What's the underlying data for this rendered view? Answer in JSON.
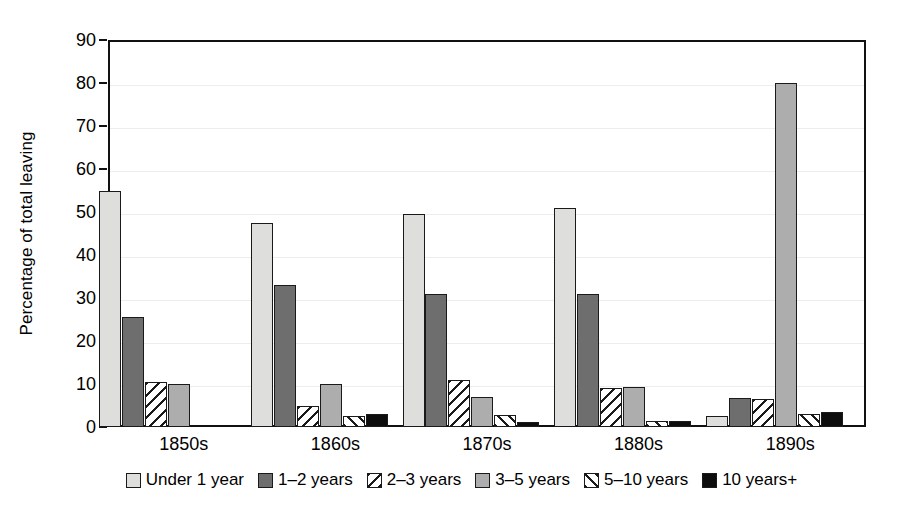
{
  "chart_data": {
    "type": "bar",
    "title": "",
    "xlabel": "",
    "ylabel": "Percentage of total leaving",
    "ylim": [
      0,
      90
    ],
    "ytick_step": 10,
    "yticks": [
      0,
      10,
      20,
      30,
      40,
      50,
      60,
      70,
      80,
      90
    ],
    "grid": true,
    "legend_position": "bottom",
    "categories": [
      "1850s",
      "1860s",
      "1870s",
      "1880s",
      "1890s"
    ],
    "series": [
      {
        "name": "Under 1 year",
        "pattern": "solid-light",
        "color": "#dededc",
        "values": [
          55,
          47.5,
          49.5,
          51,
          2.5
        ]
      },
      {
        "name": "1–2 years",
        "pattern": "solid-dark",
        "color": "#6e6e6e",
        "values": [
          25.5,
          33,
          31,
          31,
          6.8
        ]
      },
      {
        "name": "2–3 years",
        "pattern": "hatch-back",
        "color": "#ffffff",
        "values": [
          10.5,
          5,
          11,
          9,
          6.5
        ]
      },
      {
        "name": "3–5 years",
        "pattern": "solid-medium",
        "color": "#adadad",
        "values": [
          10,
          10,
          7,
          9.3,
          80
        ]
      },
      {
        "name": "5–10 years",
        "pattern": "hatch-fwd",
        "color": "#ffffff",
        "values": [
          0,
          2.6,
          2.8,
          1.5,
          3
        ]
      },
      {
        "name": "10 years+",
        "pattern": "solid-black",
        "color": "#0d0d0d",
        "values": [
          0,
          3,
          1.2,
          1.3,
          3.5
        ]
      }
    ]
  },
  "axis": {
    "y_title": "Percentage of total leaving",
    "y_labels": [
      "90",
      "80",
      "70",
      "60",
      "50",
      "40",
      "30",
      "20",
      "10",
      "0"
    ]
  },
  "legend": {
    "items": [
      {
        "label": "Under 1 year",
        "swatch": "legend-swatch-under-1-year"
      },
      {
        "label": "1–2 years",
        "swatch": "legend-swatch-1-2-years"
      },
      {
        "label": "2–3 years",
        "swatch": "legend-swatch-2-3-years"
      },
      {
        "label": "3–5 years",
        "swatch": "legend-swatch-3-5-years"
      },
      {
        "label": "5–10 years",
        "swatch": "legend-swatch-5-10-years"
      },
      {
        "label": "10 years+",
        "swatch": "legend-swatch-10-years-plus"
      }
    ]
  }
}
